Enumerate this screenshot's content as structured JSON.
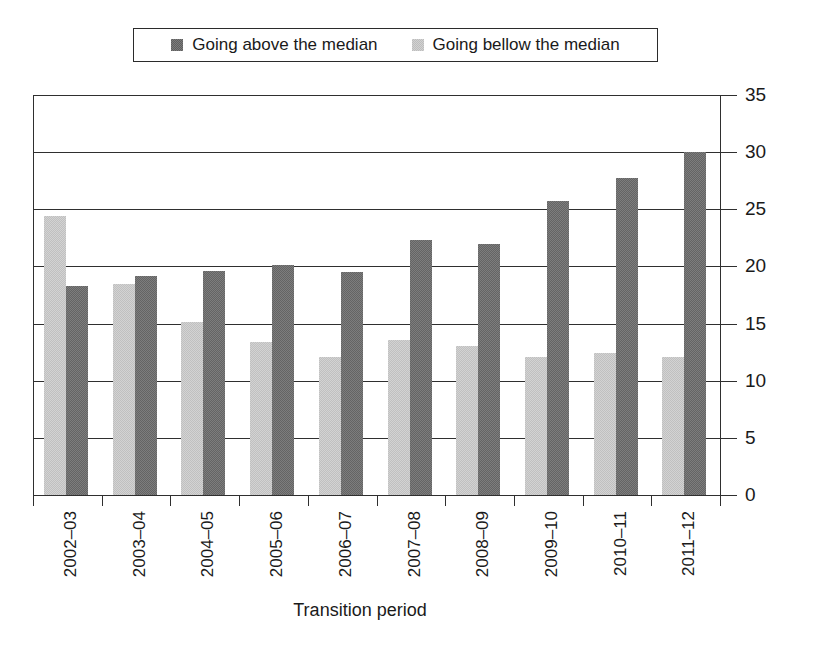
{
  "legend": {
    "position": "top-center",
    "entries": [
      {
        "label": "Going above the median",
        "swatch": "dark-gray-swatch-icon",
        "color": "#7d7d7d"
      },
      {
        "label": "Going bellow the median",
        "swatch": "light-gray-swatch-icon",
        "color": "#d3d3d3"
      }
    ]
  },
  "chart_data": {
    "type": "bar",
    "title": "",
    "xlabel": "Transition period",
    "ylabel": "",
    "ylim": [
      0,
      35
    ],
    "yticks": [
      0,
      5,
      10,
      15,
      20,
      25,
      30,
      35
    ],
    "grid": true,
    "y_axis_side": "right",
    "categories": [
      "2002–03",
      "2003–04",
      "2004–05",
      "2005–06",
      "2006–07",
      "2007–08",
      "2008–09",
      "2009–10",
      "2010–11",
      "2011–12"
    ],
    "series": [
      {
        "name": "Going bellow the median",
        "color": "#d3d3d3",
        "draw_order": 1,
        "values": [
          24.4,
          18.5,
          15.1,
          13.4,
          12.1,
          13.6,
          13.0,
          12.1,
          12.4,
          12.1
        ]
      },
      {
        "name": "Going above the median",
        "color": "#7d7d7d",
        "draw_order": 2,
        "values": [
          18.3,
          19.2,
          19.6,
          20.1,
          19.5,
          22.3,
          22.0,
          25.7,
          27.7,
          30.0
        ]
      }
    ]
  }
}
